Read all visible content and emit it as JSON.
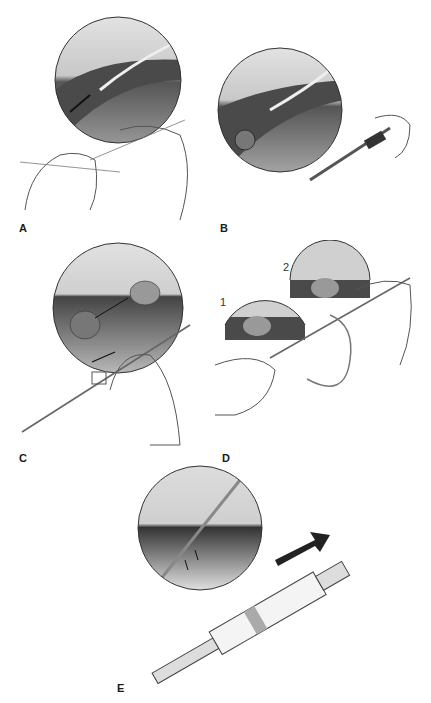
{
  "figure": {
    "type": "medical procedure illustration",
    "panels": [
      {
        "label": "A",
        "description": "Hands threading catheter; magnified inset of vessel with guidewire/catheter and arrow"
      },
      {
        "label": "B",
        "description": "Syringe inflating balloon; inset shows balloon at catheter tip in vessel"
      },
      {
        "label": "C",
        "description": "Hand advancing catheter; inset shows balloon moved along vessel with arrow"
      },
      {
        "label": "D",
        "description": "Two insets numbered 1 and 2 showing balloon positions; hands with syringe and tubing",
        "insets": [
          "1",
          "2"
        ]
      },
      {
        "label": "E",
        "description": "Syringe aspiration with large arrow; inset shows catheter tip in vessel with small arrows"
      }
    ]
  },
  "colors": {
    "tissue_dark": "#3a3a3a",
    "tissue_mid": "#8a8a8a",
    "fat_light": "#d8d8d8",
    "line": "#444444",
    "background": "#ffffff"
  }
}
